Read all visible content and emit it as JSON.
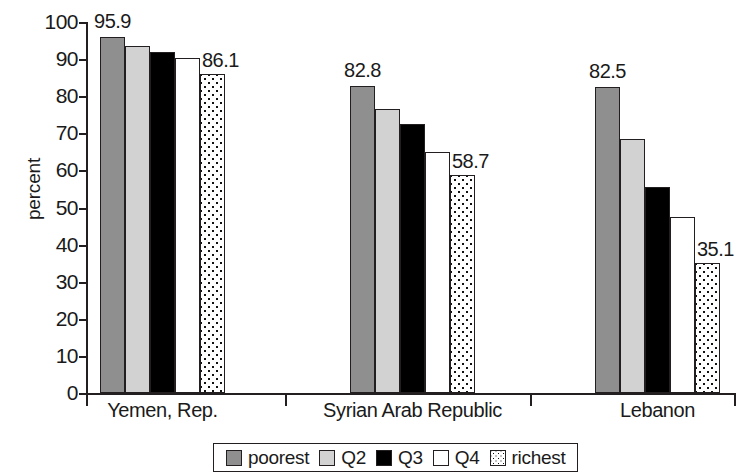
{
  "chart_data": {
    "type": "bar",
    "title": "",
    "xlabel": "",
    "ylabel": "percent",
    "ylim": [
      0,
      100
    ],
    "ytick_step": 10,
    "ytick_labels": [
      "100",
      "90",
      "80",
      "70",
      "60",
      "50",
      "40",
      "30",
      "20",
      "10",
      "0"
    ],
    "grid": false,
    "legend_position": "bottom",
    "categories": [
      "Yemen, Rep.",
      "Syrian Arab Republic",
      "Lebanon"
    ],
    "series": [
      {
        "name": "poorest",
        "values": [
          95.9,
          82.8,
          82.5
        ]
      },
      {
        "name": "Q2",
        "values": [
          93.5,
          76.5,
          68.5
        ]
      },
      {
        "name": "Q3",
        "values": [
          92.0,
          72.5,
          55.5
        ]
      },
      {
        "name": "Q4",
        "values": [
          90.3,
          65.0,
          47.5
        ]
      },
      {
        "name": "richest",
        "values": [
          86.1,
          58.7,
          35.1
        ]
      }
    ],
    "value_labels": [
      {
        "group": "Yemen, Rep.",
        "series": "poorest",
        "text": "95.9"
      },
      {
        "group": "Yemen, Rep.",
        "series": "richest",
        "text": "86.1"
      },
      {
        "group": "Syrian Arab Republic",
        "series": "poorest",
        "text": "82.8"
      },
      {
        "group": "Syrian Arab Republic",
        "series": "richest",
        "text": "58.7"
      },
      {
        "group": "Lebanon",
        "series": "poorest",
        "text": "82.5"
      },
      {
        "group": "Lebanon",
        "series": "richest",
        "text": "35.1"
      }
    ],
    "colors": {
      "poorest": "#8f8f8f",
      "Q2": "#d2d2d2",
      "Q3": "#000000",
      "Q4": "#ffffff",
      "richest": "#ffffff",
      "axis": "#231f20",
      "background": "#ffffff"
    },
    "richest_pattern": "dotted-checker"
  },
  "axis": {
    "y_title": "percent",
    "ticks": [
      "100",
      "90",
      "80",
      "70",
      "60",
      "50",
      "40",
      "30",
      "20",
      "10",
      "0"
    ]
  },
  "categories": [
    {
      "label": "Yemen, Rep."
    },
    {
      "label": "Syrian Arab Republic"
    },
    {
      "label": "Lebanon"
    }
  ],
  "legend": {
    "items": [
      {
        "label": "poorest",
        "swatch": "fill-poorest"
      },
      {
        "label": "Q2",
        "swatch": "fill-q2"
      },
      {
        "label": "Q3",
        "swatch": "fill-q3"
      },
      {
        "label": "Q4",
        "swatch": "fill-q4"
      },
      {
        "label": "richest",
        "swatch": "fill-richest"
      }
    ]
  }
}
